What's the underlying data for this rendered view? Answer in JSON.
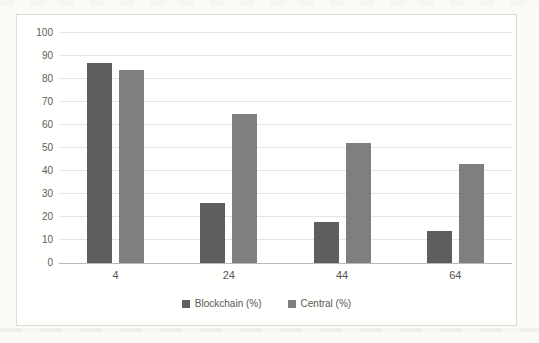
{
  "page": {
    "background": "#fbfaf7",
    "frame_border": "#dcdcda",
    "frame_background": "#fffffe"
  },
  "chart_data": {
    "type": "bar",
    "title": "",
    "xlabel": "",
    "ylabel": "",
    "categories": [
      "4",
      "24",
      "44",
      "64"
    ],
    "series": [
      {
        "name": "Blockchain (%)",
        "color": "#5e5e5e",
        "values": [
          87,
          26,
          18,
          14
        ]
      },
      {
        "name": "Central (%)",
        "color": "#7f7f7f",
        "values": [
          84,
          65,
          52,
          43
        ]
      }
    ],
    "ylim": [
      0,
      100
    ],
    "yticks": [
      0,
      10,
      20,
      30,
      40,
      50,
      60,
      70,
      80,
      90,
      100
    ],
    "grid": true,
    "gridline_color": "#e4e4e2",
    "axis_line_color": "#b9b9b7",
    "tick_label_color": "#5c5c5c",
    "legend_position": "bottom"
  }
}
